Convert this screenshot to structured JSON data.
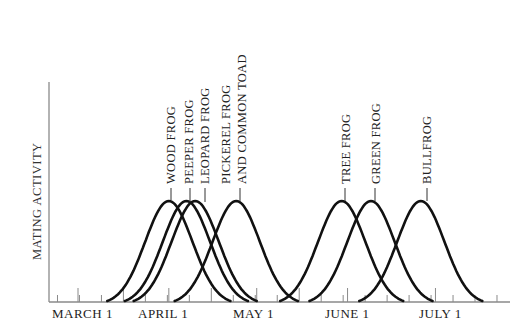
{
  "chart_data": {
    "type": "line",
    "title": "",
    "xlabel": "",
    "ylabel": "MATING ACTIVITY",
    "x_tick_labels": [
      "MARCH 1",
      "APRIL 1",
      "MAY 1",
      "JUNE 1",
      "JULY 1"
    ],
    "x_tick_days": [
      0,
      31,
      61,
      92,
      122
    ],
    "x_range_days": [
      -10,
      145
    ],
    "y_range": [
      0,
      1
    ],
    "grid": false,
    "legend": "none (curves labeled directly above peaks)",
    "curve_shape": "bell-shaped (normal-like), equal height",
    "series": [
      {
        "name": "WOOD FROG",
        "peak_date": "April 1",
        "peak_day": 31,
        "start_day": 10,
        "end_day": 52,
        "peak_value": 1.0
      },
      {
        "name": "PEEPER FROG",
        "peak_date": "April 6",
        "peak_day": 37,
        "start_day": 16,
        "end_day": 58,
        "peak_value": 1.0
      },
      {
        "name": "LEOPARD FROG",
        "peak_date": "April 8",
        "peak_day": 40,
        "start_day": 19,
        "end_day": 61,
        "peak_value": 1.0
      },
      {
        "name": "PICKEREL FROG AND COMMON TOAD",
        "peak_date": "April 24",
        "peak_day": 54,
        "start_day": 33,
        "end_day": 75,
        "peak_value": 1.0
      },
      {
        "name": "TREE FROG",
        "peak_date": "May 30",
        "peak_day": 90,
        "start_day": 69,
        "end_day": 111,
        "peak_value": 1.0
      },
      {
        "name": "GREEN FROG",
        "peak_date": "June 9",
        "peak_day": 100,
        "start_day": 79,
        "end_day": 121,
        "peak_value": 1.0
      },
      {
        "name": "BULLFROG",
        "peak_date": "June 26",
        "peak_day": 117,
        "start_day": 96,
        "end_day": 138,
        "peak_value": 1.0
      }
    ]
  },
  "labels": {
    "ylabel": "MATING ACTIVITY",
    "x": [
      "MARCH 1",
      "APRIL 1",
      "MAY 1",
      "JUNE 1",
      "JULY 1"
    ],
    "species": [
      {
        "line1": "WOOD FROG",
        "line2": ""
      },
      {
        "line1": "PEEPER FROG",
        "line2": ""
      },
      {
        "line1": "LEOPARD FROG",
        "line2": ""
      },
      {
        "line1": "PICKEREL FROG",
        "line2": "AND COMMON TOAD"
      },
      {
        "line1": "TREE FROG",
        "line2": ""
      },
      {
        "line1": "GREEN FROG",
        "line2": ""
      },
      {
        "line1": "BULLFROG",
        "line2": ""
      }
    ]
  }
}
